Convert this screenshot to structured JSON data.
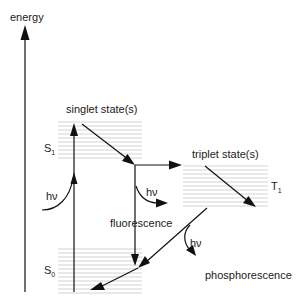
{
  "diagram": {
    "type": "jablonski",
    "labels": {
      "axis": "energy",
      "singlet_header": "singlet state(s)",
      "triplet_header": "triplet state(s)",
      "s1": "S",
      "s1_sub": "1",
      "s0": "S",
      "s0_sub": "0",
      "t1": "T",
      "t1_sub": "1",
      "hv_absorb": "hν",
      "hv_fluor": "hν",
      "hv_phos": "hν",
      "fluorescence": "fluorescence",
      "phosphorescence": "phosphorescence"
    },
    "levels": [
      {
        "name": "S1",
        "x1": 58,
        "x2": 142,
        "y_top": 122,
        "y_bottom": 160,
        "lines": 10
      },
      {
        "name": "T1",
        "x1": 183,
        "x2": 268,
        "y_top": 165,
        "y_bottom": 207,
        "lines": 11
      },
      {
        "name": "S0",
        "x1": 58,
        "x2": 142,
        "y_top": 248,
        "y_bottom": 293,
        "lines": 12
      }
    ],
    "transitions": [
      {
        "name": "absorption",
        "from": "S0",
        "to": "S1"
      },
      {
        "name": "vibrational-relaxation-s1",
        "from": "S1 upper",
        "to": "S1 lower"
      },
      {
        "name": "intersystem-crossing",
        "from": "S1",
        "to": "T1"
      },
      {
        "name": "fluorescence",
        "from": "S1",
        "to": "S0"
      },
      {
        "name": "vibrational-relaxation-t1",
        "from": "T1 upper",
        "to": "T1 lower"
      },
      {
        "name": "phosphorescence",
        "from": "T1",
        "to": "S0"
      }
    ],
    "colors": {
      "line": "#111111",
      "level": "#c8c8c8",
      "text": "#222222"
    }
  }
}
